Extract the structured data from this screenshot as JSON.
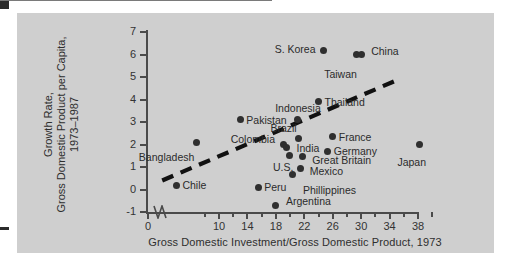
{
  "figure": {
    "background_color": "#cfcfcf",
    "page_color": "#ffffff",
    "point_color": "#2f2f2f",
    "axis_color": "#4a4a4a"
  },
  "chart_data": {
    "type": "scatter",
    "title": "",
    "xlabel": "Gross Domestic Investment/Gross Domestic Product, 1973",
    "ylabel": "Growth Rate,\nGross Domestic Product per Capita,\n1973–1987",
    "ylabel_lines": [
      "Growth Rate,",
      "Gross Domestic Product per Capita,",
      "1973–1987"
    ],
    "xlim": [
      0,
      40
    ],
    "ylim": [
      -1,
      7
    ],
    "x_axis_break": true,
    "x_tick_labels": [
      "0",
      "10",
      "14",
      "18",
      "22",
      "26",
      "30",
      "34",
      "38"
    ],
    "x_tick_values": [
      0,
      10,
      14,
      18,
      22,
      26,
      30,
      34,
      38
    ],
    "x_minor_ticks": [
      8,
      12,
      16,
      20,
      24,
      28,
      32,
      36,
      40
    ],
    "y_tick_labels": [
      "7",
      "6",
      "5",
      "4",
      "3",
      "2",
      "1",
      "0",
      "-1"
    ],
    "y_tick_values": [
      7,
      6,
      5,
      4,
      3,
      2,
      1,
      0,
      -1
    ],
    "grid": false,
    "legend": false,
    "zero_reference_line": 0,
    "trendline": {
      "style": "dashed",
      "color": "#111111",
      "x_start": 2.0,
      "y_start": 0.4,
      "x_end": 34.6,
      "y_end": 4.8
    },
    "points": [
      {
        "label": "Chile",
        "x": 4.0,
        "y": 0.2,
        "label_side": "right"
      },
      {
        "label": "Bangladesh",
        "x": 6.8,
        "y": 2.1,
        "label_side": "below-left"
      },
      {
        "label": "Peru",
        "x": 15.5,
        "y": 0.1,
        "label_side": "right"
      },
      {
        "label": "Pakistan",
        "x": 13.0,
        "y": 3.1,
        "label_side": "right"
      },
      {
        "label": "Argentina",
        "x": 18.0,
        "y": -0.7,
        "label_side": "right"
      },
      {
        "label": "Colombia",
        "x": 19.0,
        "y": 2.0,
        "label_side": "left"
      },
      {
        "label": "India",
        "x": 19.5,
        "y": 1.85,
        "label_side": "right"
      },
      {
        "label": "U.S.",
        "x": 19.9,
        "y": 1.5,
        "label_side": "below-left"
      },
      {
        "label": "Phillippines",
        "x": 20.4,
        "y": 0.65,
        "label_side": "below-right"
      },
      {
        "label": "Brazil",
        "x": 21.2,
        "y": 2.25,
        "label_side": "above-left"
      },
      {
        "label": "Indonesia",
        "x": 21.0,
        "y": 3.1,
        "label_side": "above"
      },
      {
        "label": "Mexico",
        "x": 21.5,
        "y": 0.95,
        "label_side": "right"
      },
      {
        "label": "Great Britain",
        "x": 21.7,
        "y": 1.45,
        "label_side": "right"
      },
      {
        "label": "Thailand",
        "x": 24.0,
        "y": 3.9,
        "label_side": "right"
      },
      {
        "label": "S. Korea",
        "x": 24.7,
        "y": 6.2,
        "label_side": "left"
      },
      {
        "label": "Germany",
        "x": 25.3,
        "y": 1.7,
        "label_side": "right"
      },
      {
        "label": "France",
        "x": 26.0,
        "y": 2.35,
        "label_side": "right"
      },
      {
        "label": "Taiwan",
        "x": 29.3,
        "y": 6.0,
        "label_side": "below"
      },
      {
        "label": "China",
        "x": 30.0,
        "y": 6.0,
        "label_side": "right"
      },
      {
        "label": "Japan",
        "x": 38.2,
        "y": 2.0,
        "label_side": "below"
      }
    ]
  }
}
